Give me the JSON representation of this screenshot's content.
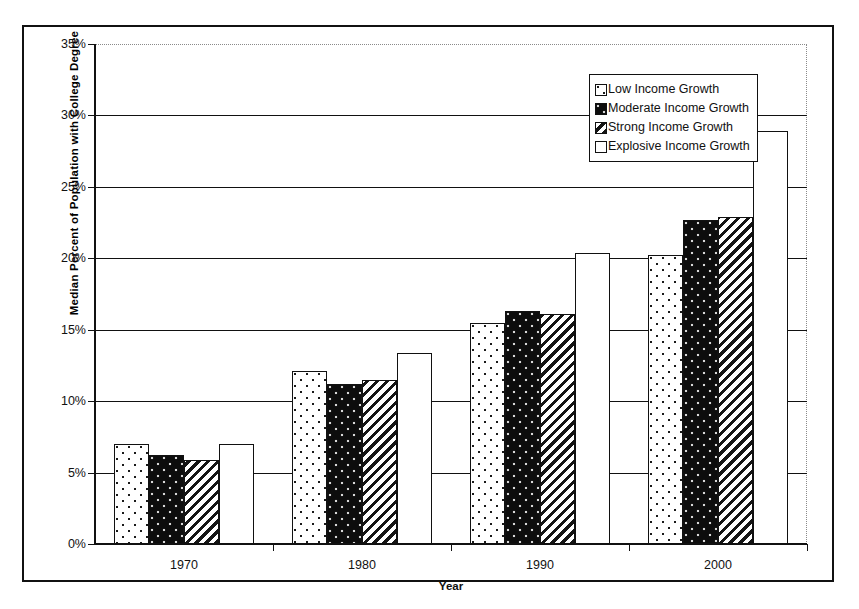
{
  "chart_data": {
    "type": "bar",
    "title": "",
    "xlabel": "Year",
    "ylabel": "Median Percent of Population with College Degree",
    "categories": [
      "1970",
      "1980",
      "1990",
      "2000"
    ],
    "ylim": [
      0,
      35
    ],
    "ytick_step": 5,
    "ytick_labels": [
      "0%",
      "5%",
      "10%",
      "15%",
      "20%",
      "25%",
      "30%",
      "35%"
    ],
    "ytick_values": [
      0,
      5,
      10,
      15,
      20,
      25,
      30,
      35
    ],
    "grid": "horizontal",
    "legend_position": "top-right",
    "value_unit": "%",
    "series": [
      {
        "name": "Low Income Growth",
        "pattern": "light-dotted",
        "values": [
          7.0,
          12.1,
          15.5,
          20.2
        ]
      },
      {
        "name": "Moderate Income Growth",
        "pattern": "dark-dotted",
        "values": [
          6.2,
          11.2,
          16.3,
          22.7
        ]
      },
      {
        "name": "Strong Income Growth",
        "pattern": "diagonal-hatch",
        "values": [
          5.9,
          11.5,
          16.1,
          22.9
        ]
      },
      {
        "name": "Explosive Income Growth",
        "pattern": "solid-white",
        "values": [
          7.0,
          13.4,
          20.4,
          28.9
        ]
      }
    ]
  },
  "colors": {
    "axis": "#111111",
    "gridline": "#111111",
    "plot_border": "#8a8a8a",
    "background": "#ffffff"
  }
}
